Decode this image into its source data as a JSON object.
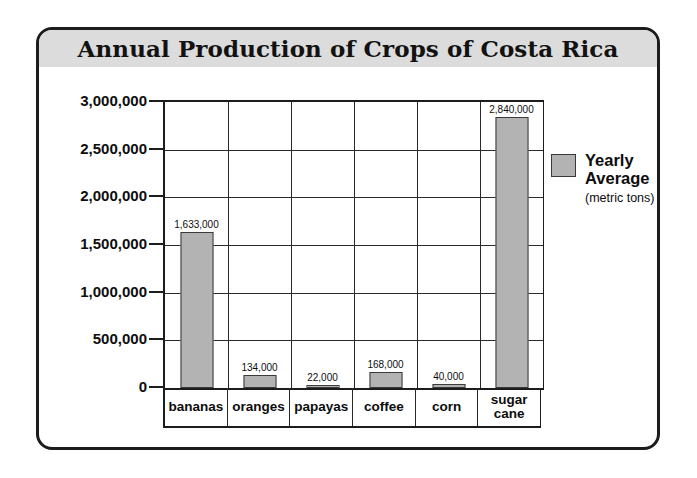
{
  "chart_data": {
    "type": "bar",
    "title": "Annual Production of Crops of Costa Rica",
    "categories": [
      "bananas",
      "oranges",
      "papayas",
      "coffee",
      "corn",
      "sugar cane"
    ],
    "values": [
      1633000,
      134000,
      22000,
      168000,
      40000,
      2840000
    ],
    "value_labels": [
      "1,633,000",
      "134,000",
      "22,000",
      "168,000",
      "40,000",
      "2,840,000"
    ],
    "series": [
      {
        "name": "Yearly Average",
        "units": "(metric tons)",
        "values": [
          1633000,
          134000,
          22000,
          168000,
          40000,
          2840000
        ],
        "color": "#b3b3b3"
      }
    ],
    "xlabel": "",
    "ylabel": "",
    "ylim": [
      0,
      3000000
    ],
    "ytick_values": [
      0,
      500000,
      1000000,
      1500000,
      2000000,
      2500000,
      3000000
    ],
    "ytick_labels": [
      "0",
      "500,000",
      "1,000,000",
      "1,500,000",
      "2,000,000",
      "2,500,000",
      "3,000,000"
    ],
    "grid": true,
    "legend_position": "right",
    "colors": {
      "bar_fill": "#b3b3b3",
      "bar_stroke": "#3a3a3a",
      "title_band": "#dcdcdc",
      "frame": "#1c1c1c",
      "text": "#0d0d0d"
    }
  },
  "legend": {
    "name": "Yearly\nAverage",
    "units": "(metric tons)"
  }
}
